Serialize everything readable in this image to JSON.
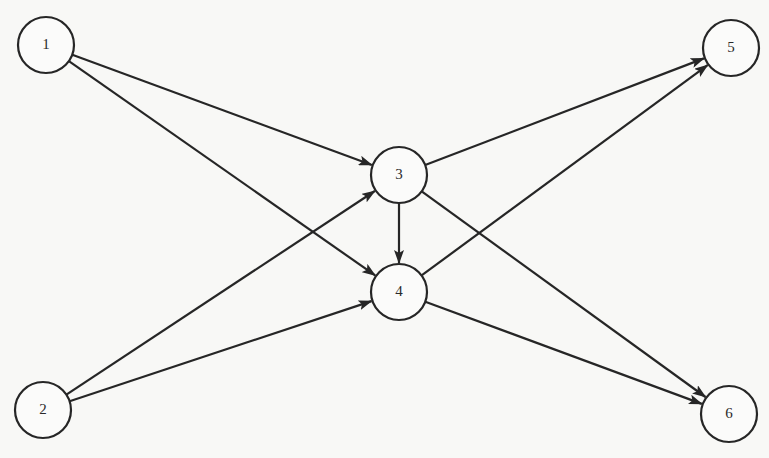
{
  "diagram": {
    "type": "directed-graph",
    "colors": {
      "stroke": "#262626",
      "background": "#f8f8f6",
      "node_fill": "#fbfbfa"
    },
    "node_radius": 28,
    "nodes": [
      {
        "id": "1",
        "label": "1",
        "x": 46,
        "y": 45
      },
      {
        "id": "2",
        "label": "2",
        "x": 43,
        "y": 410
      },
      {
        "id": "3",
        "label": "3",
        "x": 399,
        "y": 175
      },
      {
        "id": "4",
        "label": "4",
        "x": 399,
        "y": 292
      },
      {
        "id": "5",
        "label": "5",
        "x": 731,
        "y": 48
      },
      {
        "id": "6",
        "label": "6",
        "x": 729,
        "y": 414
      }
    ],
    "edges": [
      {
        "from": "1",
        "to": "3"
      },
      {
        "from": "1",
        "to": "4"
      },
      {
        "from": "2",
        "to": "3"
      },
      {
        "from": "2",
        "to": "4"
      },
      {
        "from": "3",
        "to": "4"
      },
      {
        "from": "3",
        "to": "5"
      },
      {
        "from": "3",
        "to": "6"
      },
      {
        "from": "4",
        "to": "5"
      },
      {
        "from": "4",
        "to": "6"
      }
    ]
  }
}
